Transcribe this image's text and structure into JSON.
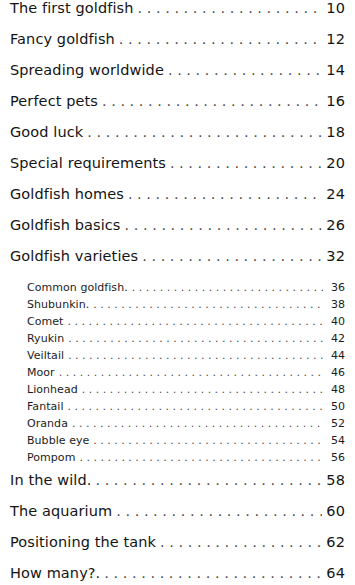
{
  "document": {
    "type": "table-of-contents",
    "background_color": "#ffffff",
    "text_color": "#141414",
    "leader_color": "#4a4a4a"
  },
  "entries": [
    {
      "level": 1,
      "title": "The first goldfish",
      "page": "10"
    },
    {
      "level": 1,
      "title": "Fancy goldfish",
      "page": "12"
    },
    {
      "level": 1,
      "title": "Spreading worldwide",
      "page": "14"
    },
    {
      "level": 1,
      "title": "Perfect pets",
      "page": "16"
    },
    {
      "level": 1,
      "title": "Good luck",
      "page": "18"
    },
    {
      "level": 1,
      "title": "Special requirements",
      "page": "20"
    },
    {
      "level": 1,
      "title": "Goldfish homes",
      "page": "24"
    },
    {
      "level": 1,
      "title": "Goldfish basics",
      "page": "26"
    },
    {
      "level": 1,
      "title": "Goldfish varieties",
      "page": "32"
    },
    {
      "level": 2,
      "title": "Common goldfish.",
      "page": "36"
    },
    {
      "level": 2,
      "title": "Shubunkin.",
      "page": "38"
    },
    {
      "level": 2,
      "title": "Comet",
      "page": "40"
    },
    {
      "level": 2,
      "title": "Ryukin",
      "page": "42"
    },
    {
      "level": 2,
      "title": "Veiltail",
      "page": "44"
    },
    {
      "level": 2,
      "title": "Moor",
      "page": "46"
    },
    {
      "level": 2,
      "title": "Lionhead",
      "page": "48"
    },
    {
      "level": 2,
      "title": "Fantail",
      "page": "50"
    },
    {
      "level": 2,
      "title": "Oranda",
      "page": "52"
    },
    {
      "level": 2,
      "title": "Bubble eye",
      "page": "54"
    },
    {
      "level": 2,
      "title": "Pompom",
      "page": "56"
    },
    {
      "level": 1,
      "title": "In the wild.",
      "page": "58"
    },
    {
      "level": 1,
      "title": "The aquarium",
      "page": "60"
    },
    {
      "level": 1,
      "title": "Positioning the tank",
      "page": "62"
    },
    {
      "level": 1,
      "title": "How many?.",
      "page": "64"
    }
  ]
}
